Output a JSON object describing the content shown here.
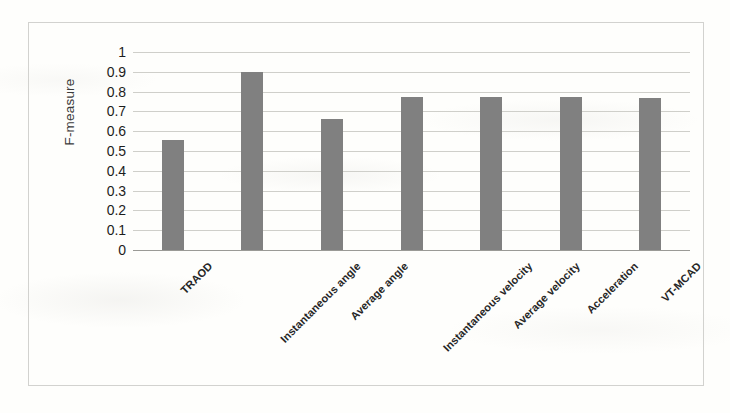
{
  "chart_data": {
    "type": "bar",
    "title": "",
    "xlabel": "",
    "ylabel": "F-measure",
    "ylim": [
      0,
      1
    ],
    "ytick_labels": [
      "1",
      "0.9",
      "0.8",
      "0.7",
      "0.6",
      "0.5",
      "0.4",
      "0.3",
      "0.2",
      "0.1",
      "0"
    ],
    "ytick_values": [
      1,
      0.9,
      0.8,
      0.7,
      0.6,
      0.5,
      0.4,
      0.3,
      0.2,
      0.1,
      0
    ],
    "grid": true,
    "legend": "none",
    "bar_color": "#808080",
    "categories": [
      "TRAOD",
      "Instantaneous angle",
      "Average angle",
      "Instantaneous velocity",
      "Average velocity",
      "Acceleration",
      "VT-MCAD"
    ],
    "values": [
      0.555,
      0.9,
      0.66,
      0.775,
      0.772,
      0.775,
      0.77
    ]
  },
  "figure": {
    "frame_color": "#d2d2cf",
    "gridline_color": "#cfcfca",
    "axis_color": "#9a9a96",
    "background_color": "#fefefc"
  }
}
